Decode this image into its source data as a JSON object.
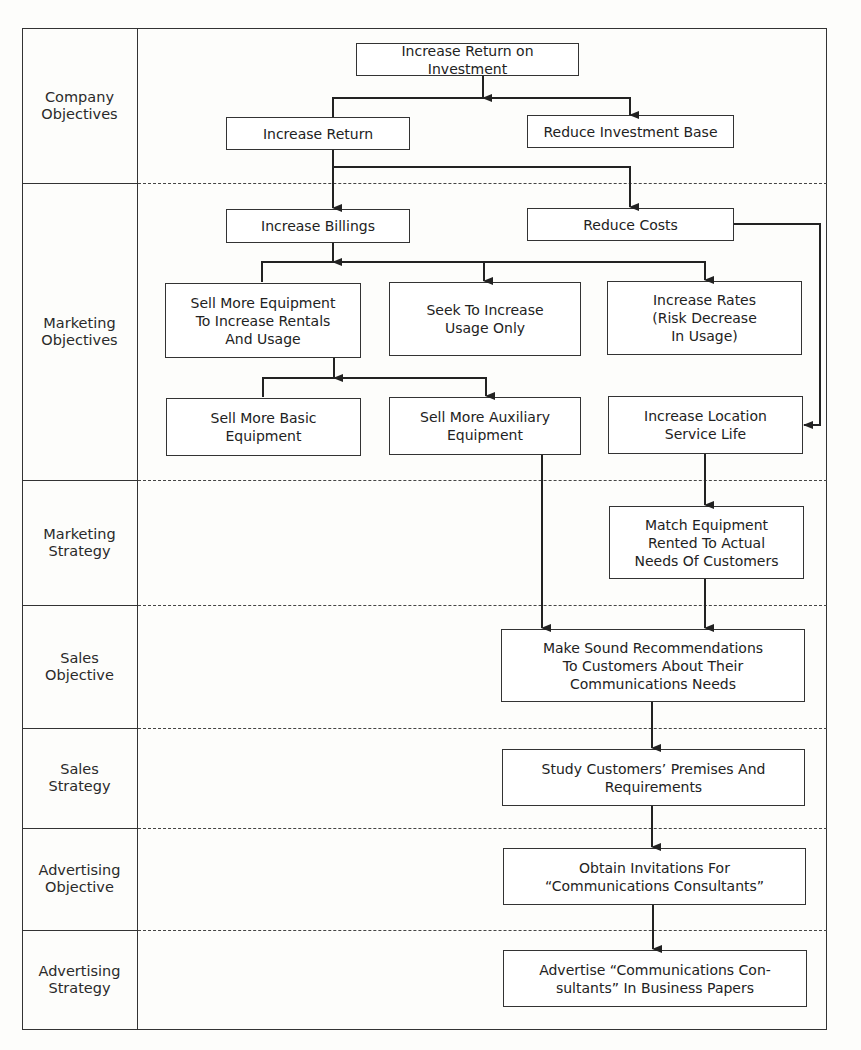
{
  "rows": [
    {
      "id": "company-objectives",
      "label": "Company\nObjectives",
      "top": 28,
      "bottom": 183
    },
    {
      "id": "marketing-objectives",
      "label": "Marketing\nObjectives",
      "top": 183,
      "bottom": 480
    },
    {
      "id": "marketing-strategy",
      "label": "Marketing\nStrategy",
      "top": 480,
      "bottom": 605
    },
    {
      "id": "sales-objective",
      "label": "Sales\nObjective",
      "top": 605,
      "bottom": 728
    },
    {
      "id": "sales-strategy",
      "label": "Sales\nStrategy",
      "top": 728,
      "bottom": 828
    },
    {
      "id": "advertising-objective",
      "label": "Advertising\nObjective",
      "top": 828,
      "bottom": 930
    },
    {
      "id": "advertising-strategy",
      "label": "Advertising\nStrategy",
      "top": 930,
      "bottom": 1030
    }
  ],
  "boxes": {
    "increase_roi": {
      "text": "Increase Return on Investment",
      "x": 356,
      "y": 43,
      "w": 223,
      "h": 33
    },
    "increase_return": {
      "text": "Increase Return",
      "x": 226,
      "y": 117,
      "w": 184,
      "h": 33
    },
    "reduce_investment_base": {
      "text": "Reduce Investment Base",
      "x": 527,
      "y": 115,
      "w": 207,
      "h": 33
    },
    "increase_billings": {
      "text": "Increase Billings",
      "x": 226,
      "y": 209,
      "w": 184,
      "h": 34
    },
    "reduce_costs": {
      "text": "Reduce Costs",
      "x": 527,
      "y": 208,
      "w": 207,
      "h": 33
    },
    "sell_more_equipment": {
      "text": "Sell More Equipment\nTo Increase Rentals\nAnd Usage",
      "x": 165,
      "y": 283,
      "w": 196,
      "h": 75
    },
    "seek_increase_usage": {
      "text": "Seek To Increase\nUsage Only",
      "x": 389,
      "y": 282,
      "w": 192,
      "h": 74
    },
    "increase_rates": {
      "text": "Increase Rates\n(Risk Decrease\nIn Usage)",
      "x": 607,
      "y": 281,
      "w": 195,
      "h": 74
    },
    "sell_basic_equipment": {
      "text": "Sell More Basic\nEquipment",
      "x": 166,
      "y": 398,
      "w": 195,
      "h": 58
    },
    "sell_auxiliary_equipment": {
      "text": "Sell More Auxiliary\nEquipment",
      "x": 389,
      "y": 397,
      "w": 192,
      "h": 58
    },
    "increase_location_life": {
      "text": "Increase Location\nService Life",
      "x": 608,
      "y": 396,
      "w": 195,
      "h": 58
    },
    "match_equipment": {
      "text": "Match Equipment\nRented To Actual\nNeeds Of Customers",
      "x": 609,
      "y": 506,
      "w": 195,
      "h": 73
    },
    "make_recommendations": {
      "text": "Make Sound Recommendations\nTo Customers About Their\nCommunications Needs",
      "x": 501,
      "y": 629,
      "w": 304,
      "h": 73
    },
    "study_premises": {
      "text": "Study Customers’ Premises And\nRequirements",
      "x": 502,
      "y": 749,
      "w": 303,
      "h": 57
    },
    "obtain_invitations": {
      "text": "Obtain Invitations For\n“Communications Consultants”",
      "x": 503,
      "y": 848,
      "w": 303,
      "h": 57
    },
    "advertise_consultants": {
      "text": "Advertise “Communications Con-\nsultants” In Business Papers",
      "x": 503,
      "y": 950,
      "w": 304,
      "h": 57
    }
  }
}
